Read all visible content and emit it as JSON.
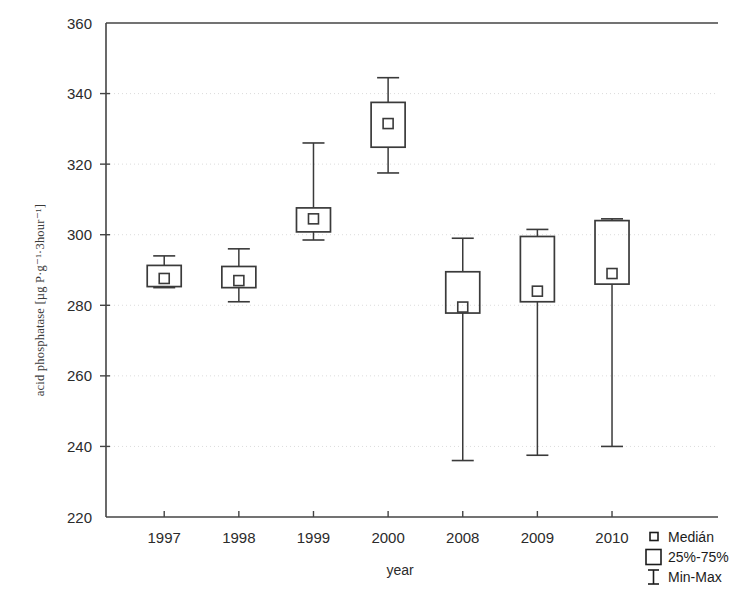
{
  "chart_data": {
    "type": "box",
    "title": "",
    "xlabel": "year",
    "ylabel": "acid phosphatase [µg P·g⁻¹·3hour⁻¹]",
    "categories": [
      "1997",
      "1998",
      "1999",
      "2000",
      "2008",
      "2009",
      "2010"
    ],
    "ylim": [
      220,
      360
    ],
    "yticks": [
      220,
      240,
      260,
      280,
      300,
      320,
      340,
      360
    ],
    "ytick_labels": [
      "220",
      "240",
      "260",
      "280",
      "300",
      "320",
      "340",
      "360"
    ],
    "grid": true,
    "legend_position": "bottom-right",
    "legend": [
      {
        "key": "median",
        "label": "Medián",
        "glyph": "small-square"
      },
      {
        "key": "quartiles",
        "label": "25%-75%",
        "glyph": "large-square"
      },
      {
        "key": "range",
        "label": "Min-Max",
        "glyph": "i-bar"
      }
    ],
    "boxes": [
      {
        "category": "1997",
        "min": 285.0,
        "q1": 285.3,
        "median": 287.6,
        "q3": 291.3,
        "max": 294.0
      },
      {
        "category": "1998",
        "min": 281.0,
        "q1": 285.0,
        "median": 287.0,
        "q3": 291.0,
        "max": 296.0
      },
      {
        "category": "1999",
        "min": 298.5,
        "q1": 300.8,
        "median": 304.5,
        "q3": 307.6,
        "max": 326.0
      },
      {
        "category": "2000",
        "min": 317.5,
        "q1": 324.8,
        "median": 331.5,
        "q3": 337.5,
        "max": 344.5
      },
      {
        "category": "2008",
        "min": 236.0,
        "q1": 277.8,
        "median": 279.5,
        "q3": 289.5,
        "max": 299.0
      },
      {
        "category": "2009",
        "min": 237.5,
        "q1": 281.0,
        "median": 284.0,
        "q3": 299.5,
        "max": 301.5
      },
      {
        "category": "2010",
        "min": 240.0,
        "q1": 286.0,
        "median": 289.0,
        "q3": 304.0,
        "max": 304.5
      }
    ]
  },
  "axes": {
    "y_title": "acid phosphatase [µg P·g⁻¹·3hour⁻¹]",
    "x_title": "year"
  },
  "colors": {
    "line": "#3a3a3a",
    "axis": "#444444",
    "grid": "#d8d8d8",
    "text": "#2b2b2b",
    "background": "#ffffff"
  }
}
